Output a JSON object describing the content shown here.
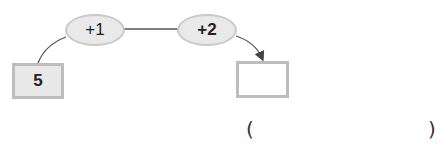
{
  "diagram": {
    "start_value": "5",
    "steps": [
      {
        "label": "+1"
      },
      {
        "label": "+2"
      }
    ],
    "answer_box": "",
    "answer_bracket": {
      "open": "(",
      "close": ")",
      "value": ""
    }
  }
}
